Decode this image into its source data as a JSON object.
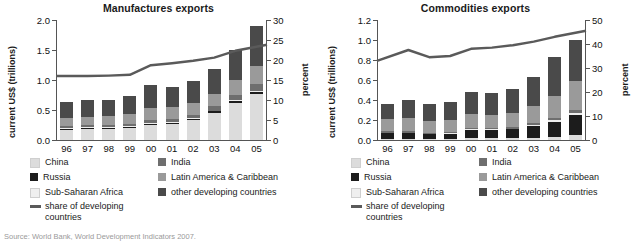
{
  "source_note": "Source: World Bank, World Development Indicators 2007.",
  "legend": {
    "items": [
      {
        "label": "China",
        "color": "#dcdcdc"
      },
      {
        "label": "India",
        "color": "#6e6e6e"
      },
      {
        "label": "Russia",
        "color": "#1c1c1c"
      },
      {
        "label": "Latin America & Caribbean",
        "color": "#9a9a9a"
      },
      {
        "label": "Sub-Saharan Africa",
        "color": "#efefef"
      },
      {
        "label": "other developing countries",
        "color": "#4a4a4a"
      }
    ],
    "line_label": "share of developing countries",
    "line_color": "#5a5a5a"
  },
  "chart_data": [
    {
      "type": "bar",
      "title": "Manufactures exports",
      "xlabel": "",
      "ylabel": "current US$ (trillions)",
      "ylabel_right": "percent",
      "categories": [
        "96",
        "97",
        "98",
        "99",
        "00",
        "01",
        "02",
        "03",
        "04",
        "05"
      ],
      "ylim": [
        0,
        2.0
      ],
      "yticks": [
        "0.0",
        "0.5",
        "1.0",
        "1.5",
        "2.0"
      ],
      "ylim_right": [
        0,
        30
      ],
      "yticks_right": [
        "0",
        "5",
        "10",
        "15",
        "20",
        "25",
        "30"
      ],
      "grid": false,
      "legend_position": "below",
      "series": [
        {
          "name": "China",
          "color": "#dcdcdc",
          "values": [
            0.17,
            0.18,
            0.18,
            0.2,
            0.25,
            0.27,
            0.33,
            0.45,
            0.62,
            0.77
          ]
        },
        {
          "name": "Russia",
          "color": "#1c1c1c",
          "values": [
            0.02,
            0.02,
            0.02,
            0.02,
            0.02,
            0.02,
            0.02,
            0.03,
            0.03,
            0.04
          ]
        },
        {
          "name": "Sub-Saharan Africa",
          "color": "#efefef",
          "values": [
            0.01,
            0.01,
            0.01,
            0.01,
            0.01,
            0.01,
            0.01,
            0.01,
            0.01,
            0.01
          ]
        },
        {
          "name": "India",
          "color": "#6e6e6e",
          "values": [
            0.04,
            0.04,
            0.04,
            0.04,
            0.05,
            0.05,
            0.06,
            0.07,
            0.09,
            0.11
          ]
        },
        {
          "name": "Latin America & Caribbean",
          "color": "#9a9a9a",
          "values": [
            0.13,
            0.14,
            0.15,
            0.16,
            0.2,
            0.2,
            0.2,
            0.21,
            0.25,
            0.3
          ]
        },
        {
          "name": "other developing countries",
          "color": "#4a4a4a",
          "values": [
            0.26,
            0.28,
            0.27,
            0.3,
            0.38,
            0.34,
            0.37,
            0.42,
            0.5,
            0.67
          ]
        }
      ],
      "line": {
        "name": "share of developing countries",
        "color": "#5a5a5a",
        "unit": "percent",
        "values": [
          16.0,
          16.0,
          16.1,
          16.3,
          18.7,
          19.2,
          19.8,
          20.6,
          22.3,
          23.8
        ]
      }
    },
    {
      "type": "bar",
      "title": "Commodities exports",
      "xlabel": "",
      "ylabel": "current US$ (trillions)",
      "ylabel_right": "percent",
      "categories": [
        "96",
        "97",
        "98",
        "99",
        "00",
        "01",
        "02",
        "03",
        "04",
        "05"
      ],
      "ylim": [
        0,
        1.2
      ],
      "yticks": [
        "0.0",
        "0.2",
        "0.4",
        "0.6",
        "0.8",
        "1.0",
        "1.2"
      ],
      "ylim_right": [
        0,
        50
      ],
      "yticks_right": [
        "0",
        "10",
        "20",
        "30",
        "40",
        "50"
      ],
      "grid": false,
      "legend_position": "below",
      "series": [
        {
          "name": "China",
          "color": "#dcdcdc",
          "values": [
            0.015,
            0.015,
            0.013,
            0.013,
            0.018,
            0.018,
            0.02,
            0.025,
            0.035,
            0.05
          ]
        },
        {
          "name": "Russia",
          "color": "#1c1c1c",
          "values": [
            0.055,
            0.055,
            0.045,
            0.05,
            0.085,
            0.085,
            0.088,
            0.115,
            0.15,
            0.2
          ]
        },
        {
          "name": "Sub-Saharan Africa",
          "color": "#efefef",
          "values": [
            0.005,
            0.005,
            0.005,
            0.005,
            0.007,
            0.007,
            0.007,
            0.01,
            0.013,
            0.018
          ]
        },
        {
          "name": "India",
          "color": "#6e6e6e",
          "values": [
            0.012,
            0.012,
            0.012,
            0.012,
            0.015,
            0.015,
            0.016,
            0.02,
            0.025,
            0.032
          ]
        },
        {
          "name": "Latin America & Caribbean",
          "color": "#9a9a9a",
          "values": [
            0.125,
            0.13,
            0.12,
            0.12,
            0.135,
            0.13,
            0.14,
            0.17,
            0.215,
            0.29
          ]
        },
        {
          "name": "other developing countries",
          "color": "#4a4a4a",
          "values": [
            0.148,
            0.188,
            0.17,
            0.18,
            0.22,
            0.22,
            0.24,
            0.29,
            0.39,
            0.41
          ]
        }
      ],
      "line": {
        "name": "share of developing countries",
        "color": "#5a5a5a",
        "unit": "percent",
        "values": [
          33.0,
          37.5,
          34.5,
          35.0,
          38.0,
          38.5,
          39.5,
          41.0,
          43.0,
          45.5
        ]
      }
    }
  ]
}
